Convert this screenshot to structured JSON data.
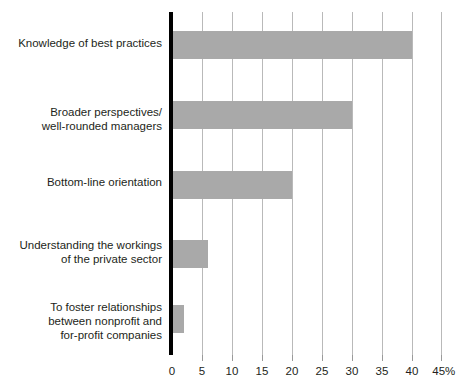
{
  "chart_data": {
    "type": "bar",
    "orientation": "horizontal",
    "title": "",
    "subtitle": "",
    "xlabel": "",
    "ylabel": "",
    "categories": [
      "Knowledge of best practices",
      "Broader perspectives/\nwell-rounded managers",
      "Bottom-line orientation",
      "Understanding the workings\nof the private sector",
      "To foster relationships\nbetween nonprofit and\nfor-profit companies"
    ],
    "values": [
      40,
      30,
      20,
      6,
      2
    ],
    "value_unit": "%",
    "xlim": [
      0,
      45
    ],
    "xticks": [
      0,
      5,
      10,
      15,
      20,
      25,
      30,
      35,
      40,
      45
    ],
    "xticklabels": [
      "0",
      "5",
      "10",
      "15",
      "20",
      "25",
      "30",
      "35",
      "40",
      "45%"
    ],
    "grid": "vertical",
    "legend": "none",
    "bar_color": "#a9a9a9",
    "axis_color": "#000000",
    "gridline_color": "#b9b9b9",
    "background_color": "#ffffff",
    "annotations": []
  }
}
